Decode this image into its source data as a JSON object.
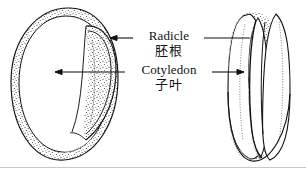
{
  "figure": {
    "width": 306,
    "height": 172,
    "background_color": "#ffffff",
    "ink_color": "#111111",
    "rule_color": "#c8c8c8"
  },
  "labels": {
    "radicle": {
      "english": "Radicle",
      "chinese": "胚根"
    },
    "cotyledon": {
      "english": "Cotyledon",
      "chinese": "子叶"
    }
  },
  "specimens": {
    "left": {
      "name": "seed-side-view",
      "description": "Large rounded seed shown from the side with curved radicle along right margin"
    },
    "right": {
      "name": "seed-end-view",
      "description": "Elongated upright seed shown end-on with paired cotyledon lobes"
    }
  },
  "leaders": {
    "radicle_left": "arrow pointing left to radicle on left specimen",
    "radicle_right": "line extending right to radicle on right specimen",
    "cotyledon_left": "arrow pointing left to cotyledon on left specimen",
    "cotyledon_right": "arrow pointing right to cotyledon on right specimen"
  }
}
